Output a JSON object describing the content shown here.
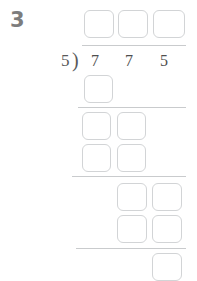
{
  "worksheet": {
    "problem_number": "3",
    "type": "long-division",
    "divisor": "5",
    "divisor_bracket": ")",
    "dividend_digits": [
      "7",
      "7",
      "5"
    ],
    "dividend": "775",
    "colors": {
      "background": "#ffffff",
      "box_border": "#d2d4d6",
      "rule": "#c9cbcd",
      "digit_text": "#4f4f4f",
      "divisor_text": "#5a5a5a",
      "problem_number_text": "#7d7d7d"
    },
    "quotient_boxes": [
      {
        "name": "quotient-box-hundreds",
        "value": ""
      },
      {
        "name": "quotient-box-tens",
        "value": ""
      },
      {
        "name": "quotient-box-ones",
        "value": ""
      }
    ],
    "work_rows": [
      {
        "name": "work-row-1",
        "boxes": [
          {
            "value": ""
          }
        ]
      },
      {
        "name": "work-row-2",
        "boxes": [
          {
            "value": ""
          },
          {
            "value": ""
          }
        ]
      },
      {
        "name": "work-row-3",
        "boxes": [
          {
            "value": ""
          },
          {
            "value": ""
          }
        ]
      },
      {
        "name": "work-row-4",
        "boxes": [
          {
            "value": ""
          },
          {
            "value": ""
          }
        ]
      },
      {
        "name": "work-row-5",
        "boxes": [
          {
            "value": ""
          },
          {
            "value": ""
          }
        ]
      },
      {
        "name": "remainder-row",
        "boxes": [
          {
            "value": ""
          }
        ]
      }
    ]
  }
}
